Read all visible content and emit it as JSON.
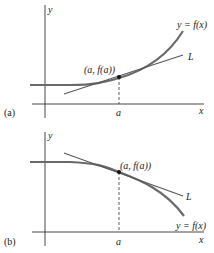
{
  "colors": {
    "curve": "#6a6a6a",
    "tangent": "#555555",
    "axis": "#333333",
    "point": "#111111",
    "text": "#222222"
  },
  "panels": [
    {
      "id": "a",
      "panel_label": "(a)",
      "x_axis_label": "x",
      "y_axis_label": "y",
      "tick_label": "a",
      "curve_label": "y = f(x)",
      "tangent_label": "L",
      "point_label": "(a, f(a))",
      "description": "Concave up curve; tangent line L lies below the curve"
    },
    {
      "id": "b",
      "panel_label": "(b)",
      "x_axis_label": "x",
      "y_axis_label": "y",
      "tick_label": "a",
      "curve_label": "y = f(x)",
      "tangent_label": "L",
      "point_label": "(a, f(a))",
      "description": "Concave down curve; tangent line L lies above the curve"
    }
  ]
}
